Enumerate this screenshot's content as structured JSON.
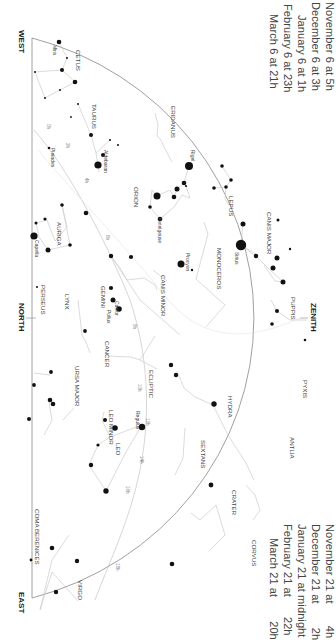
{
  "captions": {
    "top": [
      {
        "date": "November 6 at",
        "time": "5h"
      },
      {
        "date": "December 6 at",
        "time": "3h"
      },
      {
        "date": "January 6 at",
        "time": "1h"
      },
      {
        "date": "February 6 at",
        "time": "23h"
      },
      {
        "date": "March 6 at",
        "time": "21h"
      }
    ],
    "bottom": [
      {
        "date": "November 21 at",
        "time": "4h"
      },
      {
        "date": "December 21 at",
        "time": "2h"
      },
      {
        "date": "January 21 at midnight",
        "time": ""
      },
      {
        "date": "February 21 at",
        "time": "22h"
      },
      {
        "date": "March 21 at",
        "time": "20h"
      }
    ]
  },
  "directions": {
    "west": "WEST",
    "north": "NORTH",
    "east": "EAST",
    "zenith": "ZENITH"
  },
  "constellations": [
    {
      "name": "CETUS"
    },
    {
      "name": "TAURUS"
    },
    {
      "name": "ERIDANUS"
    },
    {
      "name": "PERSEUS"
    },
    {
      "name": "AURIGA"
    },
    {
      "name": "ORION"
    },
    {
      "name": "LEPUS"
    },
    {
      "name": "CANIS MAJOR"
    },
    {
      "name": "MONOCEROS"
    },
    {
      "name": "GEMINI"
    },
    {
      "name": "CANIS MINOR"
    },
    {
      "name": "PUPPIS"
    },
    {
      "name": "LYNX"
    },
    {
      "name": "CANCER"
    },
    {
      "name": "PYXIS"
    },
    {
      "name": "ECLIPTIC"
    },
    {
      "name": "HYDRA"
    },
    {
      "name": "ANTLIA"
    },
    {
      "name": "URSA MAJOR"
    },
    {
      "name": "LEO MINOR"
    },
    {
      "name": "SEXTANS"
    },
    {
      "name": "LEO"
    },
    {
      "name": "CRATER"
    },
    {
      "name": "CORVUS"
    },
    {
      "name": "COMA BERENICES"
    },
    {
      "name": "VIRGO"
    }
  ],
  "stars": [
    {
      "name": "Mira"
    },
    {
      "name": "Aldebaran"
    },
    {
      "name": "Pleiades"
    },
    {
      "name": "Rigel"
    },
    {
      "name": "Betelgeuse"
    },
    {
      "name": "Capella"
    },
    {
      "name": "Sirius"
    },
    {
      "name": "Procyon"
    },
    {
      "name": "Castor"
    },
    {
      "name": "Pollux"
    },
    {
      "name": "Regulus"
    }
  ],
  "ecliptic_marks": [
    "0h",
    "2h",
    "4h",
    "6h",
    "8h",
    "10h",
    "12h",
    "14h",
    "16h",
    "18h"
  ],
  "colors": {
    "lines": "#cccccc",
    "horizon": "#777777",
    "stars": "#111111",
    "text": "#444444"
  }
}
